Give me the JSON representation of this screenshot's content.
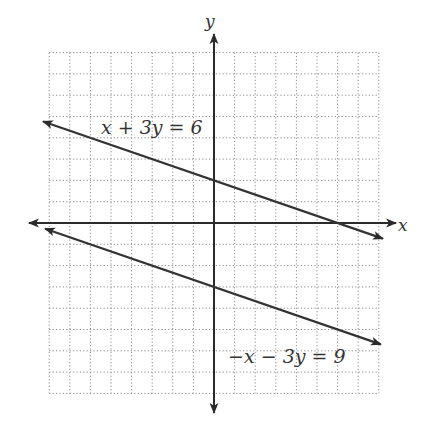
{
  "chart_data": {
    "type": "line",
    "title": "",
    "xlabel": "x",
    "ylabel": "y",
    "xlim": [
      -8,
      8
    ],
    "ylim": [
      -8,
      8
    ],
    "grid": true,
    "grid_style": "dotted",
    "grid_step": 1,
    "tick_labels": false,
    "series": [
      {
        "name": "x + 3y = 6",
        "equation": "x + 3y = 6",
        "slope": -0.3333,
        "y_intercept": 2,
        "x_intercept": 6,
        "x_range": [
          -8.3,
          8.2
        ],
        "arrows": "both"
      },
      {
        "name": "−x − 3y = 9",
        "equation": "-x - 3y = 9",
        "slope": -0.3333,
        "y_intercept": -3,
        "x_intercept": -9,
        "x_range": [
          -8.2,
          8.1
        ],
        "arrows": "both"
      }
    ],
    "annotations": [
      {
        "text": "x + 3y = 6",
        "x": -5.5,
        "y": 4.0
      },
      {
        "text": "−x − 3y = 9",
        "x": 0.6,
        "y": -6.2
      }
    ],
    "colors": {
      "lines": "#333333",
      "axes": "#2b2b2b",
      "grid": "#8a8a8a",
      "background": "#ffffff"
    }
  },
  "labels": {
    "x_axis": "x",
    "y_axis": "y",
    "line1": "x + 3y = 6",
    "line2": "−x − 3y = 9"
  }
}
